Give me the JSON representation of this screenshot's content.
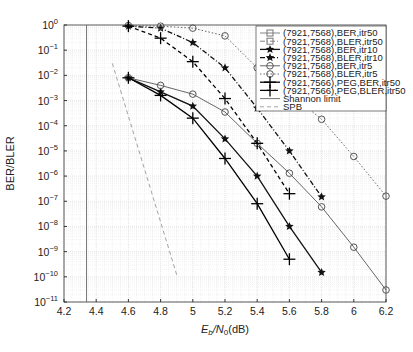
{
  "chart_data": {
    "type": "line",
    "title": "",
    "xlabel": "Eb/N0(dB)",
    "ylabel": "BER/BLER",
    "xlim": [
      4.2,
      6.2
    ],
    "ylim_log10": [
      -11,
      0
    ],
    "yscale": "log",
    "grid": true,
    "legend_position": "upper right",
    "x_ticks": [
      "4.2",
      "4.4",
      "4.6",
      "4.8",
      "5",
      "5.2",
      "5.4",
      "5.6",
      "5.8",
      "6",
      "6.2"
    ],
    "y_ticks": [
      "10^0",
      "10^-1",
      "10^-2",
      "10^-3",
      "10^-4",
      "10^-5",
      "10^-6",
      "10^-7",
      "10^-8",
      "10^-9",
      "10^-10",
      "10^-11"
    ],
    "series": [
      {
        "name": "(7921,7568),BER,itr50",
        "marker": "square",
        "style": "solid",
        "color": "#777777",
        "x": [],
        "y": []
      },
      {
        "name": "(7921,7568),BLER,itr50",
        "marker": "square",
        "style": "dashdot",
        "color": "#777777",
        "x": [],
        "y": []
      },
      {
        "name": "(7921,7568),BER,itr10",
        "marker": "star",
        "style": "solid",
        "color": "#111111",
        "x": [
          4.6,
          4.8,
          5.0,
          5.2,
          5.4,
          5.6,
          5.8
        ],
        "y": [
          0.008,
          0.0022,
          0.0006,
          3e-05,
          1e-06,
          1e-08,
          1.5e-10
        ]
      },
      {
        "name": "(7921,7568),BLER,itr10",
        "marker": "star",
        "style": "dashdot",
        "color": "#111111",
        "x": [
          4.6,
          4.8,
          5.0,
          5.2,
          5.4,
          5.6,
          5.8
        ],
        "y": [
          0.9,
          0.75,
          0.2,
          0.02,
          0.0005,
          1e-05,
          1.5e-07
        ]
      },
      {
        "name": "(7921,7568),BER,itr5",
        "marker": "circle",
        "style": "solid",
        "color": "#555555",
        "x": [
          4.6,
          4.8,
          5.0,
          5.2,
          5.4,
          5.6,
          5.8,
          6.0,
          6.2
        ],
        "y": [
          0.008,
          0.004,
          0.0018,
          0.00035,
          2e-05,
          1.3e-06,
          6e-08,
          1.5e-09,
          3e-11
        ]
      },
      {
        "name": "(7921,7568),BLER,itr5",
        "marker": "circle",
        "style": "dotted",
        "color": "#555555",
        "x": [
          4.6,
          4.8,
          5.0,
          5.2,
          5.4,
          5.6,
          5.8,
          6.0,
          6.2
        ],
        "y": [
          0.95,
          0.9,
          0.75,
          0.37,
          0.02,
          0.002,
          0.00018,
          6e-06,
          1.6e-07
        ]
      },
      {
        "name": "(7921,7566),PEG,BER,itr50",
        "marker": "plus",
        "style": "solid",
        "color": "#000000",
        "x": [
          4.6,
          4.8,
          5.0,
          5.2,
          5.4,
          5.6
        ],
        "y": [
          0.008,
          0.0016,
          0.0002,
          5e-06,
          8e-08,
          5e-10
        ]
      },
      {
        "name": "(7921,7566),PEG,BLER,itr50",
        "marker": "plus",
        "style": "dashed",
        "color": "#000000",
        "x": [
          4.6,
          4.8,
          5.0,
          5.2,
          5.4,
          5.6
        ],
        "y": [
          0.9,
          0.3,
          0.035,
          0.0012,
          2e-05,
          2e-07
        ]
      },
      {
        "name": "Shannon limit",
        "marker": "none",
        "style": "solid",
        "color": "#666666",
        "x": [
          4.34,
          4.34
        ],
        "y": [
          1,
          1e-11
        ]
      },
      {
        "name": "SPB",
        "marker": "none",
        "style": "dashed",
        "color": "#999999",
        "x": [
          4.5,
          4.9
        ],
        "y": [
          0.03,
          1.2e-10
        ]
      }
    ]
  }
}
